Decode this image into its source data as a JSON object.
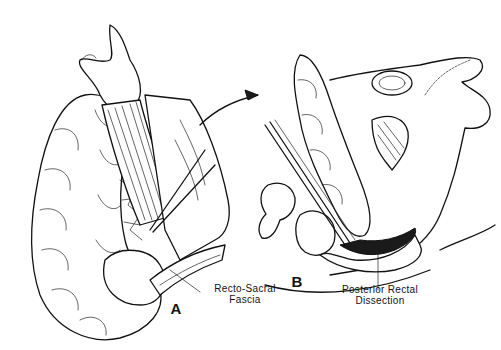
{
  "figure": {
    "panels": [
      {
        "id": "A",
        "letter": "A",
        "callout": {
          "line1": "Recto-Sacral",
          "line2": "Fascia"
        }
      },
      {
        "id": "B",
        "letter": "B",
        "callout": {
          "line1": "Posterior Rectal",
          "line2": "Dissection"
        }
      }
    ],
    "arrow": "transition-arrow",
    "colors": {
      "ink": "#111111",
      "background": "#ffffff"
    }
  }
}
